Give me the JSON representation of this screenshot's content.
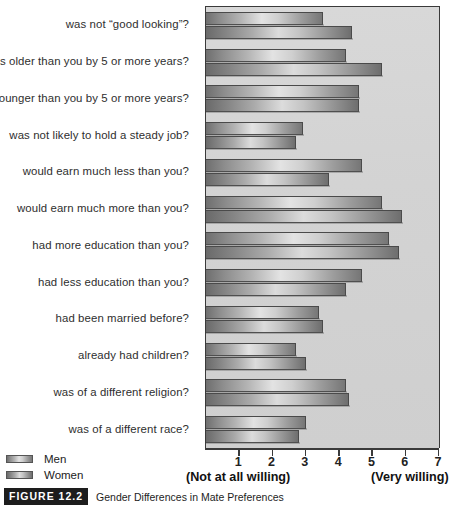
{
  "chart_data": {
    "type": "bar",
    "orientation": "horizontal",
    "title": "",
    "xlabel": "",
    "ylabel": "",
    "xlim": [
      0,
      7
    ],
    "grid": false,
    "legend_position": "bottom-left",
    "axis_left_note": "(Not at all willing)",
    "axis_right_note": "(Very willing)",
    "tick_labels": [
      "1",
      "2",
      "3",
      "4",
      "5",
      "6",
      "7"
    ],
    "tick_values": [
      1,
      2,
      3,
      4,
      5,
      6,
      7
    ],
    "categories": [
      "was not “good looking”?",
      "was older than you by 5 or more years?",
      "was younger than you by 5 or more years?",
      "was not likely to hold a steady job?",
      "would earn much less than you?",
      "would earn much more than you?",
      "had more education than you?",
      "had less education than you?",
      "had been married before?",
      "already had children?",
      "was of a different religion?",
      "was of a different race?"
    ],
    "series": [
      {
        "name": "Men",
        "values": [
          3.5,
          4.2,
          4.6,
          2.9,
          4.7,
          5.3,
          5.5,
          4.7,
          3.4,
          2.7,
          4.2,
          3.0
        ]
      },
      {
        "name": "Women",
        "values": [
          4.4,
          5.3,
          4.6,
          2.7,
          3.7,
          5.9,
          5.8,
          4.2,
          3.5,
          3.0,
          4.3,
          2.8
        ]
      }
    ]
  },
  "legend": {
    "items": [
      {
        "label": "Men"
      },
      {
        "label": "Women"
      }
    ]
  },
  "caption": {
    "tag": "FIGURE 12.2",
    "text": "Gender Differences in Mate Preferences"
  },
  "colors": {
    "plot_background": "#d4d4d4",
    "axis": "#3a3a3a",
    "bar_men_light": "#e3e3e3",
    "bar_men_dark": "#6f6f6f",
    "bar_women_light": "#dcdcdc",
    "bar_women_dark": "#6a6a6a",
    "text": "#222222"
  }
}
